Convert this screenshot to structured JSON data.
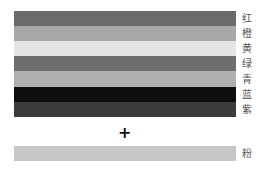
{
  "spectrum": {
    "bars": [
      {
        "label": "红",
        "color": "#6a6a6a"
      },
      {
        "label": "橙",
        "color": "#a8a8a8"
      },
      {
        "label": "黄",
        "color": "#e4e4e4"
      },
      {
        "label": "绿",
        "color": "#6e6e6e"
      },
      {
        "label": "青",
        "color": "#b0b0b0"
      },
      {
        "label": "蓝",
        "color": "#0e0e0e"
      },
      {
        "label": "紫",
        "color": "#3c3c3c"
      }
    ]
  },
  "operator": {
    "symbol": "+"
  },
  "result": {
    "label": "粉",
    "color": "#c6c6c6"
  }
}
